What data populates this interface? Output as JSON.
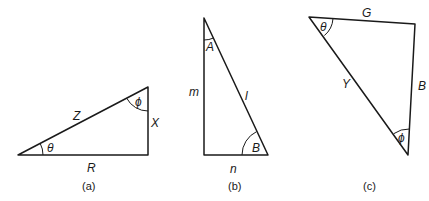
{
  "figure": {
    "triangles": [
      {
        "id": "a",
        "caption": "(a)",
        "vertices": {
          "left": [
            18,
            155
          ],
          "right": [
            148,
            155
          ],
          "top": [
            148,
            87
          ]
        },
        "sides": {
          "hypotenuse": "Z",
          "vertical": "X",
          "base": "R"
        },
        "angles": {
          "at_left": "θ",
          "at_top": "ϕ"
        }
      },
      {
        "id": "b",
        "caption": "(b)",
        "vertices": {
          "top": [
            204,
            18
          ],
          "bottom_left": [
            204,
            155
          ],
          "bottom_right": [
            268,
            155
          ]
        },
        "sides": {
          "vertical": "m",
          "hypotenuse": "l",
          "base": "n"
        },
        "angles": {
          "at_top": "A",
          "at_bottom_right": "B"
        }
      },
      {
        "id": "c",
        "caption": "(c)",
        "vertices": {
          "top_left": [
            309,
            17
          ],
          "top_right": [
            415,
            24
          ],
          "bottom": [
            408,
            155
          ]
        },
        "sides": {
          "top": "G",
          "right": "B",
          "hypotenuse": "Y"
        },
        "angles": {
          "at_top_left": "θ",
          "at_bottom": "ϕ"
        }
      }
    ]
  }
}
